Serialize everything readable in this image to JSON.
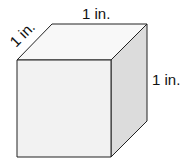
{
  "diagram": {
    "type": "cube",
    "labels": {
      "top_edge": "1 in.",
      "depth_edge": "1 in.",
      "right_edge": "1 in."
    },
    "colors": {
      "front_face": "#f2f2f2",
      "top_face": "#f8f8f8",
      "side_face": "#dcdcdc",
      "stroke": "#222222"
    }
  }
}
